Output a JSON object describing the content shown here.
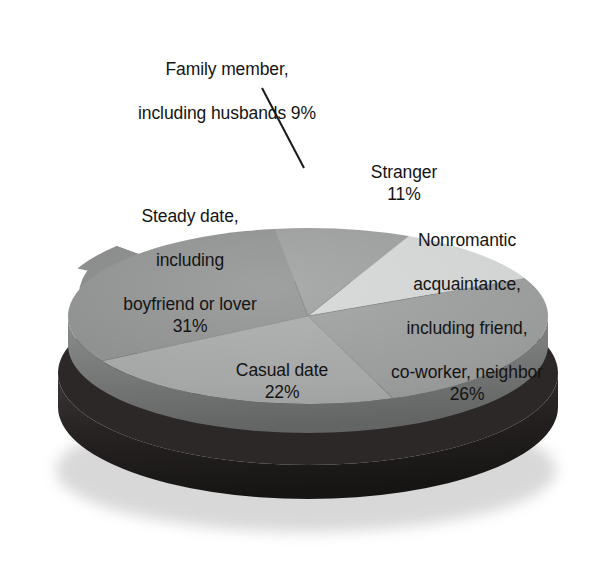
{
  "chart_data": {
    "type": "pie",
    "title": "",
    "subtitle": "",
    "xlabel": "",
    "ylabel": "",
    "legend_position": "none",
    "grid": false,
    "style": "3d-exploded-disc",
    "units": "percent",
    "total": 99,
    "categories": [
      "Family member, including husbands",
      "Stranger",
      "Nonromantic acquaintance, including friend, co-worker, neighbor",
      "Casual date",
      "Steady date, including boyfriend or lover"
    ],
    "values": [
      9,
      11,
      26,
      22,
      31
    ],
    "slices": [
      {
        "key": "family",
        "label_lines": [
          "Family member,",
          "including husbands 9%"
        ],
        "value": 9,
        "percent_text": "9%",
        "color": "#9a9b9b",
        "side_color": "#6f7070",
        "start_angle": -17,
        "end_angle": 15.4,
        "leader_line": true
      },
      {
        "key": "stranger",
        "label_lines": [
          "Stranger"
        ],
        "value": 11,
        "percent_text": "11%",
        "color": "#d2d3d3",
        "side_color": "#9b9c9c",
        "start_angle": 15.4,
        "end_angle": 55
      },
      {
        "key": "nonromantic",
        "label_lines": [
          "Nonromantic",
          "acquaintance,",
          "including friend,",
          "co-worker, neighbor"
        ],
        "value": 26,
        "percent_text": "26%",
        "color": "#9a9b9b",
        "side_color": "#6f7070",
        "start_angle": 55,
        "end_angle": 148.6
      },
      {
        "key": "casual",
        "label_lines": [
          "Casual date"
        ],
        "value": 22,
        "percent_text": "22%",
        "color": "#a5a6a6",
        "side_color": "#77797a",
        "start_angle": 148.6,
        "end_angle": 227.8
      },
      {
        "key": "steady",
        "label_lines": [
          "Steady date,",
          "including",
          "boyfriend or lover"
        ],
        "value": 31,
        "percent_text": "31%",
        "color": "#8d8e8e",
        "side_color": "#656666",
        "start_angle": 227.8,
        "end_angle": 343
      }
    ],
    "colors": {
      "base_disc": "#23201f",
      "base_disc_top": "#2e2b2a",
      "rim_shadow": "#6b6c6c",
      "label_text": "#141414",
      "leader_line": "#1a1a1a",
      "background": "#ffffff"
    }
  },
  "labels": {
    "family": {
      "line1": "Family member,",
      "line2": "including husbands 9%"
    },
    "stranger": {
      "name": "Stranger",
      "percent": "11%"
    },
    "nonromantic": {
      "line1": "Nonromantic",
      "line2": "acquaintance,",
      "line3": "including friend,",
      "line4": "co-worker, neighbor",
      "percent": "26%"
    },
    "casual": {
      "name": "Casual date",
      "percent": "22%"
    },
    "steady": {
      "line1": "Steady date,",
      "line2": "including",
      "line3": "boyfriend or lover",
      "percent": "31%"
    }
  }
}
